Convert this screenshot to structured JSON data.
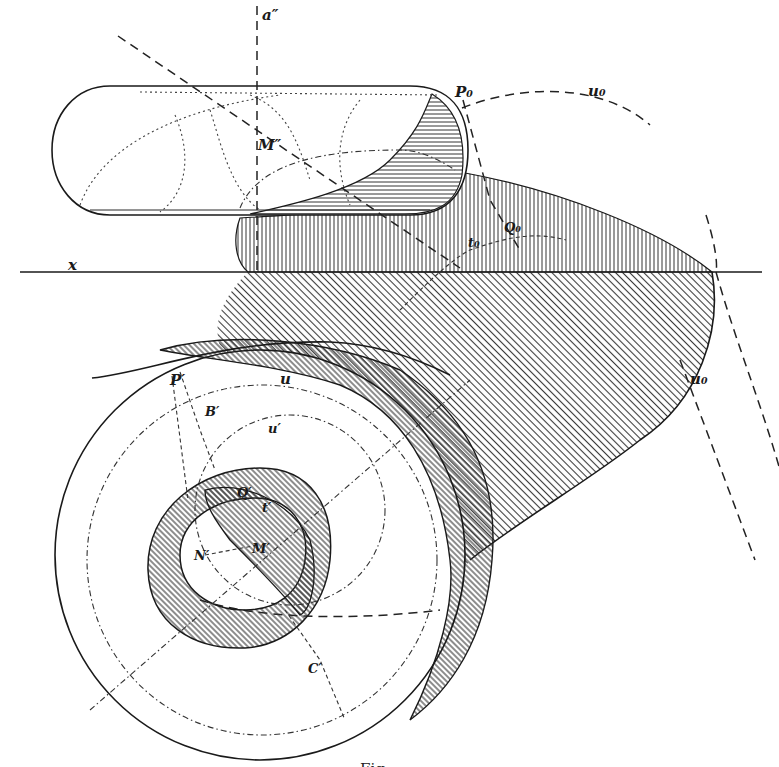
{
  "figure": {
    "caption": "Fig. ...",
    "colors": {
      "ink": "#1a1a1a",
      "paper": "#ffffff",
      "hatch": "#3a3a3a"
    }
  },
  "labels": {
    "a_double_prime": "a″",
    "M_double_prime": "M″",
    "P_zero": "P₀",
    "u_zero_top": "u₀",
    "x_axis": "x",
    "t_zero": "t₀",
    "Q_zero": "Q₀",
    "u_zero_right": "u₀",
    "P_prime": "P′",
    "u": "u",
    "B_prime": "B′",
    "u_prime": "u′",
    "Q_prime": "Q′",
    "t_prime": "t′",
    "N_prime": "N′",
    "M_prime": "M′",
    "C_prime": "C′"
  },
  "views": {
    "elevation": "front view (upper) — inclined torus/ring, horizontal hatching shadow",
    "ground_line": "x",
    "plan": "top view (lower) — concentric ring with cast shadow, diagonal hatching"
  }
}
